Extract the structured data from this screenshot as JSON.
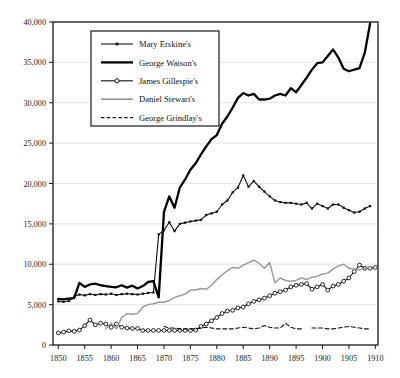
{
  "chart_data": {
    "type": "line",
    "title": "",
    "xlabel": "",
    "ylabel": "",
    "xlim": [
      1849,
      1910.5
    ],
    "ylim": [
      0,
      40000
    ],
    "grid": true,
    "grid_axis": "y",
    "legend_position": "upper-left-inside",
    "xticks": [
      1850,
      1855,
      1860,
      1865,
      1870,
      1875,
      1880,
      1885,
      1890,
      1895,
      1900,
      1905,
      1910
    ],
    "xtick_labels": [
      "1850",
      "1855",
      "1860",
      "1865",
      "1870",
      "1875",
      "1880",
      "1885",
      "1890",
      "1895",
      "1900",
      "1905",
      "1910"
    ],
    "yticks": [
      0,
      5000,
      10000,
      15000,
      20000,
      25000,
      30000,
      35000,
      40000
    ],
    "ytick_labels": [
      "0",
      "5,000",
      "10,000",
      "15,000",
      "20,000",
      "25,000",
      "30,000",
      "35,000",
      "40,000"
    ],
    "series": [
      {
        "name": "Mary Erskine's",
        "style": "line-with-small-square-markers",
        "color": "#111111",
        "points": [
          [
            1850,
            5400
          ],
          [
            1851,
            5350
          ],
          [
            1852,
            5450
          ],
          [
            1853,
            6000
          ],
          [
            1854,
            6250
          ],
          [
            1855,
            6150
          ],
          [
            1856,
            6300
          ],
          [
            1857,
            6200
          ],
          [
            1858,
            6300
          ],
          [
            1859,
            6250
          ],
          [
            1860,
            6350
          ],
          [
            1861,
            6200
          ],
          [
            1862,
            6300
          ],
          [
            1863,
            6350
          ],
          [
            1864,
            6300
          ],
          [
            1865,
            6250
          ],
          [
            1866,
            6350
          ],
          [
            1867,
            6450
          ],
          [
            1868,
            6500
          ],
          [
            1869,
            13700
          ],
          [
            1870,
            14200
          ],
          [
            1871,
            15200
          ],
          [
            1872,
            14100
          ],
          [
            1873,
            15000
          ],
          [
            1874,
            15150
          ],
          [
            1875,
            15300
          ],
          [
            1876,
            15400
          ],
          [
            1877,
            15500
          ],
          [
            1878,
            16100
          ],
          [
            1879,
            16300
          ],
          [
            1880,
            16500
          ],
          [
            1881,
            17400
          ],
          [
            1882,
            17900
          ],
          [
            1883,
            18900
          ],
          [
            1884,
            19500
          ],
          [
            1885,
            21000
          ],
          [
            1886,
            19600
          ],
          [
            1887,
            20300
          ],
          [
            1888,
            19600
          ],
          [
            1889,
            19000
          ],
          [
            1890,
            18400
          ],
          [
            1891,
            17900
          ],
          [
            1892,
            17700
          ],
          [
            1893,
            17600
          ],
          [
            1894,
            17600
          ],
          [
            1895,
            17500
          ],
          [
            1896,
            17400
          ],
          [
            1897,
            17600
          ],
          [
            1898,
            16900
          ],
          [
            1899,
            17500
          ],
          [
            1900,
            17200
          ],
          [
            1901,
            16900
          ],
          [
            1902,
            17400
          ],
          [
            1903,
            17400
          ],
          [
            1904,
            17000
          ],
          [
            1905,
            16700
          ],
          [
            1906,
            16400
          ],
          [
            1907,
            16500
          ],
          [
            1908,
            16900
          ],
          [
            1909,
            17200
          ]
        ]
      },
      {
        "name": "George Watson's",
        "style": "thick-solid-line",
        "color": "#000000",
        "points": [
          [
            1850,
            5700
          ],
          [
            1851,
            5650
          ],
          [
            1852,
            5750
          ],
          [
            1853,
            5800
          ],
          [
            1854,
            7700
          ],
          [
            1855,
            7200
          ],
          [
            1856,
            7500
          ],
          [
            1857,
            7600
          ],
          [
            1858,
            7400
          ],
          [
            1859,
            7300
          ],
          [
            1860,
            7200
          ],
          [
            1861,
            7150
          ],
          [
            1862,
            7400
          ],
          [
            1863,
            7100
          ],
          [
            1864,
            7350
          ],
          [
            1865,
            7000
          ],
          [
            1866,
            7300
          ],
          [
            1867,
            7800
          ],
          [
            1868,
            7900
          ],
          [
            1869,
            5900
          ],
          [
            1870,
            16500
          ],
          [
            1871,
            18400
          ],
          [
            1872,
            17000
          ],
          [
            1873,
            19500
          ],
          [
            1874,
            20500
          ],
          [
            1875,
            21700
          ],
          [
            1876,
            22500
          ],
          [
            1877,
            23600
          ],
          [
            1878,
            24600
          ],
          [
            1879,
            25500
          ],
          [
            1880,
            26000
          ],
          [
            1881,
            27400
          ],
          [
            1882,
            28300
          ],
          [
            1883,
            29400
          ],
          [
            1884,
            30600
          ],
          [
            1885,
            31200
          ],
          [
            1886,
            30900
          ],
          [
            1887,
            31100
          ],
          [
            1888,
            30400
          ],
          [
            1889,
            30400
          ],
          [
            1890,
            30500
          ],
          [
            1891,
            30900
          ],
          [
            1892,
            31100
          ],
          [
            1893,
            30900
          ],
          [
            1894,
            31800
          ],
          [
            1895,
            31300
          ],
          [
            1896,
            32200
          ],
          [
            1897,
            33100
          ],
          [
            1898,
            34100
          ],
          [
            1899,
            34900
          ],
          [
            1900,
            35000
          ],
          [
            1901,
            35800
          ],
          [
            1902,
            36600
          ],
          [
            1903,
            35600
          ],
          [
            1904,
            34200
          ],
          [
            1905,
            33900
          ],
          [
            1906,
            34100
          ],
          [
            1907,
            34300
          ],
          [
            1908,
            36200
          ],
          [
            1909,
            39800
          ]
        ]
      },
      {
        "name": "James Gillespie's",
        "style": "line-with-open-circle-markers",
        "color": "#111111",
        "points": [
          [
            1850,
            1500
          ],
          [
            1851,
            1600
          ],
          [
            1852,
            1750
          ],
          [
            1853,
            1700
          ],
          [
            1854,
            1850
          ],
          [
            1855,
            2400
          ],
          [
            1856,
            3100
          ],
          [
            1857,
            2500
          ],
          [
            1858,
            2700
          ],
          [
            1859,
            2600
          ],
          [
            1860,
            2200
          ],
          [
            1861,
            2600
          ],
          [
            1862,
            2200
          ],
          [
            1863,
            2100
          ],
          [
            1864,
            2050
          ],
          [
            1865,
            2050
          ],
          [
            1866,
            1800
          ],
          [
            1867,
            1800
          ],
          [
            1868,
            1800
          ],
          [
            1869,
            1800
          ],
          [
            1870,
            1800
          ],
          [
            1871,
            1800
          ],
          [
            1872,
            1800
          ],
          [
            1873,
            1800
          ],
          [
            1874,
            1800
          ],
          [
            1875,
            1800
          ],
          [
            1876,
            1850
          ],
          [
            1877,
            2300
          ],
          [
            1878,
            2600
          ],
          [
            1879,
            3000
          ],
          [
            1880,
            3400
          ],
          [
            1881,
            3900
          ],
          [
            1882,
            4200
          ],
          [
            1883,
            4300
          ],
          [
            1884,
            4600
          ],
          [
            1885,
            4700
          ],
          [
            1886,
            5100
          ],
          [
            1887,
            5400
          ],
          [
            1888,
            5600
          ],
          [
            1889,
            5800
          ],
          [
            1890,
            6100
          ],
          [
            1891,
            6400
          ],
          [
            1892,
            6600
          ],
          [
            1893,
            6800
          ],
          [
            1894,
            7200
          ],
          [
            1895,
            7400
          ],
          [
            1896,
            7500
          ],
          [
            1897,
            7600
          ],
          [
            1898,
            6900
          ],
          [
            1899,
            7200
          ],
          [
            1900,
            7500
          ],
          [
            1901,
            6800
          ],
          [
            1902,
            7300
          ],
          [
            1903,
            7500
          ],
          [
            1904,
            7900
          ],
          [
            1905,
            8300
          ],
          [
            1906,
            9100
          ],
          [
            1907,
            9900
          ],
          [
            1908,
            9500
          ],
          [
            1909,
            9500
          ],
          [
            1910,
            9600
          ]
        ]
      },
      {
        "name": "Daniel Stewart's",
        "style": "gray-solid-line",
        "color": "#9a9a9a",
        "points": [
          [
            1859,
            2000
          ],
          [
            1860,
            2700
          ],
          [
            1861,
            2000
          ],
          [
            1862,
            3400
          ],
          [
            1863,
            3900
          ],
          [
            1864,
            3800
          ],
          [
            1865,
            3900
          ],
          [
            1866,
            4700
          ],
          [
            1867,
            5000
          ],
          [
            1868,
            5100
          ],
          [
            1869,
            5300
          ],
          [
            1870,
            5300
          ],
          [
            1871,
            5500
          ],
          [
            1872,
            5900
          ],
          [
            1873,
            6100
          ],
          [
            1874,
            6300
          ],
          [
            1875,
            6800
          ],
          [
            1876,
            6800
          ],
          [
            1877,
            7000
          ],
          [
            1878,
            6900
          ],
          [
            1879,
            7400
          ],
          [
            1880,
            8100
          ],
          [
            1881,
            8700
          ],
          [
            1882,
            9200
          ],
          [
            1883,
            9600
          ],
          [
            1884,
            9500
          ],
          [
            1885,
            9900
          ],
          [
            1886,
            10200
          ],
          [
            1887,
            10500
          ],
          [
            1888,
            10100
          ],
          [
            1889,
            9500
          ],
          [
            1890,
            10200
          ],
          [
            1891,
            7700
          ],
          [
            1892,
            8300
          ],
          [
            1893,
            8000
          ],
          [
            1894,
            7900
          ],
          [
            1895,
            8000
          ],
          [
            1896,
            8300
          ],
          [
            1897,
            8100
          ],
          [
            1898,
            8400
          ],
          [
            1899,
            8500
          ],
          [
            1900,
            8800
          ],
          [
            1901,
            8900
          ],
          [
            1902,
            9400
          ],
          [
            1903,
            9800
          ],
          [
            1904,
            10000
          ],
          [
            1905,
            9500
          ],
          [
            1906,
            9400
          ],
          [
            1907,
            9300
          ],
          [
            1908,
            9500
          ],
          [
            1909,
            9700
          ]
        ]
      },
      {
        "name": "George Grindlay's",
        "style": "dashed-line",
        "color": "#111111",
        "points": [
          [
            1870,
            2300
          ],
          [
            1871,
            2100
          ],
          [
            1872,
            2100
          ],
          [
            1873,
            2000
          ],
          [
            1874,
            2000
          ],
          [
            1875,
            2000
          ],
          [
            1876,
            2000
          ],
          [
            1877,
            2100
          ],
          [
            1878,
            2200
          ],
          [
            1879,
            2100
          ],
          [
            1880,
            2000
          ],
          [
            1881,
            2000
          ],
          [
            1882,
            2000
          ],
          [
            1883,
            2000
          ],
          [
            1884,
            2100
          ],
          [
            1885,
            2200
          ],
          [
            1886,
            2100
          ],
          [
            1887,
            2000
          ],
          [
            1888,
            2100
          ],
          [
            1889,
            2400
          ],
          [
            1890,
            2200
          ],
          [
            1891,
            2100
          ],
          [
            1892,
            2100
          ],
          [
            1893,
            2700
          ],
          [
            1894,
            2200
          ],
          [
            1895,
            2000
          ],
          [
            1896,
            2000
          ],
          [
            1898,
            2100
          ],
          [
            1899,
            2100
          ],
          [
            1900,
            2100
          ],
          [
            1901,
            2000
          ],
          [
            1902,
            2000
          ],
          [
            1903,
            2100
          ],
          [
            1904,
            2200
          ],
          [
            1905,
            2300
          ],
          [
            1906,
            2200
          ],
          [
            1907,
            2100
          ],
          [
            1908,
            2000
          ],
          [
            1909,
            2000
          ]
        ]
      }
    ],
    "legend": [
      {
        "label": "Mary Erskine's",
        "key": "mary-erskines"
      },
      {
        "label": "George Watson's",
        "key": "george-watsons"
      },
      {
        "label": "James Gillespie's",
        "key": "james-gillespies"
      },
      {
        "label": "Daniel Stewart's",
        "key": "daniel-stewarts"
      },
      {
        "label": "George Grindlay's",
        "key": "george-grindlays"
      }
    ]
  },
  "colors": {
    "axis": "#1a1a1a",
    "grid": "#d8d8d8",
    "background": "#ffffff",
    "gray_series": "#9a9a9a",
    "black_series": "#000000"
  }
}
